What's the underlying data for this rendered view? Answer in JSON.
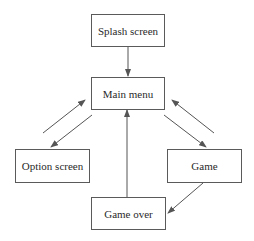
{
  "diagram": {
    "type": "state-flow",
    "nodes": [
      {
        "id": "splash",
        "label": "Splash screen"
      },
      {
        "id": "main",
        "label": "Main menu"
      },
      {
        "id": "option",
        "label": "Option screen"
      },
      {
        "id": "game",
        "label": "Game"
      },
      {
        "id": "gameover",
        "label": "Game over"
      }
    ],
    "edges": [
      {
        "from": "splash",
        "to": "main"
      },
      {
        "from": "main",
        "to": "option"
      },
      {
        "from": "option",
        "to": "main"
      },
      {
        "from": "main",
        "to": "game"
      },
      {
        "from": "game",
        "to": "main"
      },
      {
        "from": "game",
        "to": "gameover"
      },
      {
        "from": "gameover",
        "to": "main"
      }
    ]
  },
  "colors": {
    "line": "#555555",
    "text": "#2a2a2a",
    "background": "#ffffff"
  }
}
